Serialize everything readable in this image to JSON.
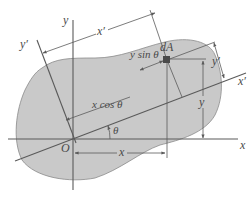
{
  "diagram": {
    "type": "rotated-axes-area-element",
    "colors": {
      "region_fill": "#c9c9c9",
      "region_stroke": "#8a8a8a",
      "line": "#5a5a5a",
      "text": "#4a4a4a",
      "element_dA": "#4a4a4a"
    },
    "labels": {
      "axis_x": "x",
      "axis_y": "y",
      "axis_x_prime": "x′",
      "axis_y_prime_left": "y′",
      "origin": "O",
      "element": "dA",
      "dim_x_prime": "x′",
      "dim_y_prime": "y′",
      "dim_x": "x",
      "dim_y": "y",
      "x_cos_theta": "x cos θ",
      "y_sin_theta": "y sin θ",
      "angle": "θ"
    }
  }
}
